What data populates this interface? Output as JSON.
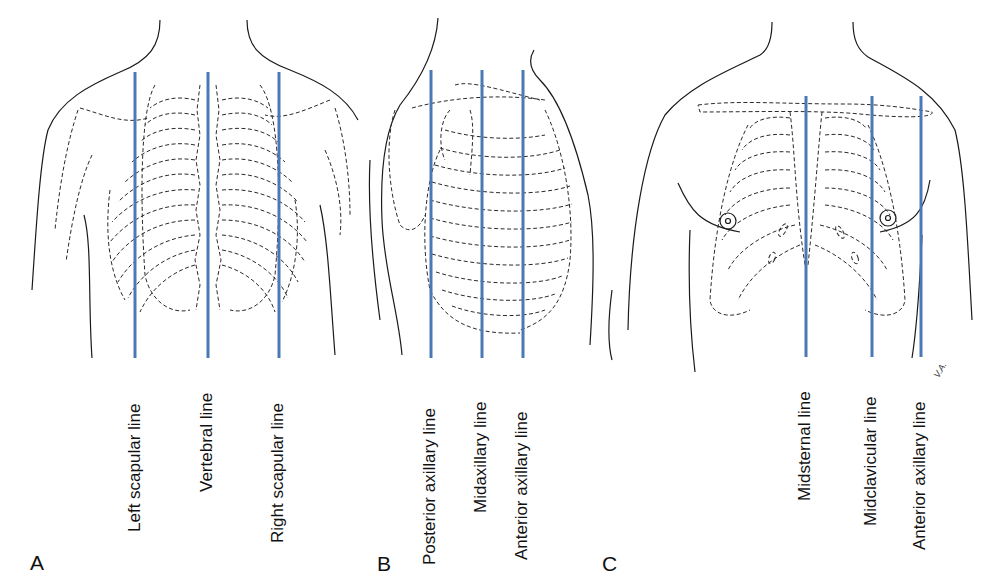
{
  "figure": {
    "line_color": "#4a7ab5",
    "panels": [
      {
        "letter": "A",
        "view": "posterior",
        "lines": [
          {
            "label": "Left scapular line",
            "x": 135
          },
          {
            "label": "Vertebral line",
            "x": 208
          },
          {
            "label": "Right scapular line",
            "x": 279
          }
        ]
      },
      {
        "letter": "B",
        "view": "lateral",
        "lines": [
          {
            "label": "Posterior axillary line",
            "x": 431
          },
          {
            "label": "Midaxillary line",
            "x": 482
          },
          {
            "label": "Anterior axillary line",
            "x": 523
          }
        ]
      },
      {
        "letter": "C",
        "view": "anterior",
        "lines": [
          {
            "label": "Midsternal line",
            "x": 806
          },
          {
            "label": "Midclavicular line",
            "x": 872
          },
          {
            "label": "Anterior axillary line",
            "x": 921
          }
        ]
      }
    ],
    "signature": "V.A."
  }
}
